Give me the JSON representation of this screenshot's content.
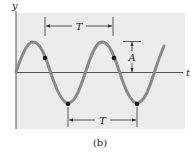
{
  "figure": {
    "caption": "(b)",
    "y_axis_label": "y",
    "t_axis_label": "t",
    "period_label_top": "T",
    "period_label_bottom": "T",
    "amplitude_label": "A"
  },
  "colors": {
    "panel": "#ececec",
    "wave": "#8a8a8a",
    "axis": "#555555",
    "dot": "#111111",
    "annotation": "#333333"
  }
}
